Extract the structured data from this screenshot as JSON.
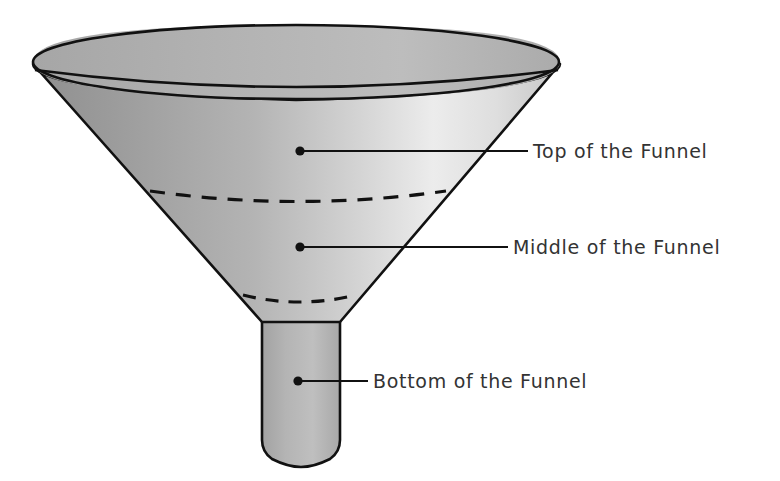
{
  "diagram": {
    "type": "funnel-illustration",
    "background_color": "#ffffff"
  },
  "labels": [
    {
      "id": "top",
      "text": "Top of the Funnel",
      "dot": {
        "x": 300,
        "y": 151
      },
      "line_end_x": 528,
      "text_x": 533,
      "text_y": 151
    },
    {
      "id": "middle",
      "text": "Middle of the Funnel",
      "dot": {
        "x": 300,
        "y": 247
      },
      "line_end_x": 508,
      "text_x": 513,
      "text_y": 247
    },
    {
      "id": "bottom",
      "text": "Bottom of the Funnel",
      "dot": {
        "x": 298,
        "y": 381
      },
      "line_end_x": 368,
      "text_x": 373,
      "text_y": 381
    }
  ],
  "funnel": {
    "rim_outer": {
      "cx": 296,
      "cy": 57,
      "rx": 264,
      "ry": 32
    },
    "rim_inner": {
      "cx": 296,
      "cy": 72,
      "rx": 258,
      "ry": 28
    },
    "cone_left_x": 33,
    "cone_right_x": 560,
    "cone_top_y": 72,
    "cone_bottom_y": 322,
    "stem_left_x": 262,
    "stem_right_x": 340,
    "stem_bottom_y": 465,
    "dashed_arcs": [
      {
        "id": "upper",
        "x1": 150,
        "x2": 445,
        "y": 192,
        "sag": 11
      },
      {
        "id": "lower",
        "x1": 243,
        "x2": 355,
        "y": 296,
        "sag": 7
      }
    ]
  },
  "colors": {
    "outline": "#111111",
    "text": "#333333",
    "cone_dark": "#949494",
    "cone_mid": "#b8b8b8",
    "cone_light": "#e9e9e9",
    "cone_edge_right": "#cfcfcf",
    "rim_band": "#b0b0b0",
    "stem_fill": "#b5b5b5",
    "dash": "#111111"
  }
}
